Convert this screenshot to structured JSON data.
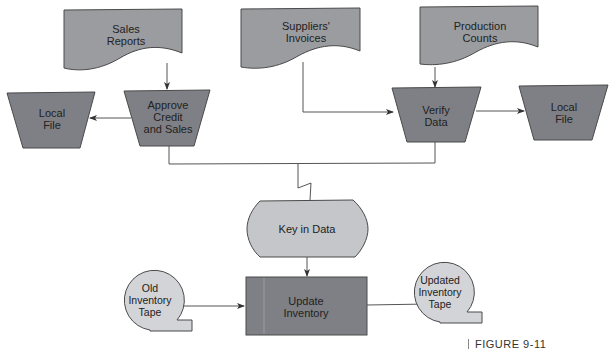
{
  "diagram": {
    "type": "system flowchart",
    "colors": {
      "document_fill": "#9a9ca0",
      "process_fill": "#7e8085",
      "file_fill": "#7e8085",
      "manual_input_fill": "#c4c6c9",
      "tape_fill": "#d2d4d7",
      "stroke": "#4a4a4a",
      "line": "#555555"
    },
    "nodes": {
      "sales_reports": {
        "shape": "document",
        "label_line1": "Sales",
        "label_line2": "Reports"
      },
      "suppliers_invoices": {
        "shape": "document",
        "label_line1": "Suppliers'",
        "label_line2": "Invoices"
      },
      "production_counts": {
        "shape": "document",
        "label_line1": "Production",
        "label_line2": "Counts"
      },
      "local_file_left": {
        "shape": "offline-storage",
        "label_line1": "Local",
        "label_line2": "File"
      },
      "approve_credit": {
        "shape": "manual-operation",
        "label_line1": "Approve",
        "label_line2": "Credit",
        "label_line3": "and Sales"
      },
      "verify_data": {
        "shape": "manual-operation",
        "label_line1": "Verify",
        "label_line2": "Data"
      },
      "local_file_right": {
        "shape": "offline-storage",
        "label_line1": "Local",
        "label_line2": "File"
      },
      "key_in_data": {
        "shape": "display",
        "label": "Key in Data"
      },
      "update_inventory": {
        "shape": "process",
        "label_line1": "Update",
        "label_line2": "Inventory"
      },
      "old_tape": {
        "shape": "magnetic-tape",
        "label_line1": "Old",
        "label_line2": "Inventory",
        "label_line3": "Tape"
      },
      "updated_tape": {
        "shape": "magnetic-tape",
        "label_line1": "Updated",
        "label_line2": "Inventory",
        "label_line3": "Tape"
      }
    },
    "edges": [
      {
        "from": "Sales Reports",
        "to": "Approve Credit and Sales"
      },
      {
        "from": "Approve Credit and Sales",
        "to": "Local File (left)"
      },
      {
        "from": "Suppliers' Invoices",
        "to": "Verify Data"
      },
      {
        "from": "Production Counts",
        "to": "Verify Data"
      },
      {
        "from": "Verify Data",
        "to": "Local File (right)"
      },
      {
        "from": "Approve Credit and Sales + Verify Data",
        "to": "Key in Data",
        "style": "communication link"
      },
      {
        "from": "Key in Data",
        "to": "Update Inventory"
      },
      {
        "from": "Old Inventory Tape",
        "to": "Update Inventory"
      },
      {
        "from": "Update Inventory",
        "to": "Updated Inventory Tape"
      }
    ],
    "figure_label": "FIGURE 9-11"
  }
}
